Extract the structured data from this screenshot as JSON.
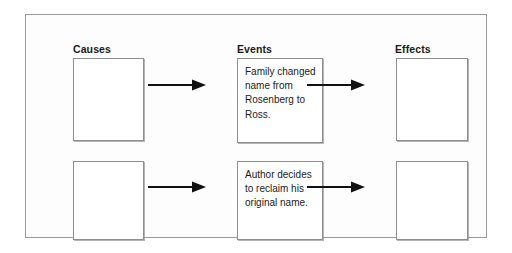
{
  "diagram": {
    "type": "cause-event-effect-organizer",
    "columns": [
      {
        "id": "causes",
        "label": "Causes"
      },
      {
        "id": "events",
        "label": "Events"
      },
      {
        "id": "effects",
        "label": "Effects"
      }
    ],
    "rows": [
      {
        "causes_text": "",
        "events_text": "Family changed name from Rosenberg to Ross.",
        "effects_text": ""
      },
      {
        "causes_text": "",
        "events_text": "Author decides to reclaim his original name.",
        "effects_text": ""
      }
    ],
    "arrows": [
      {
        "id": "causes-to-events-row1",
        "direction": "right"
      },
      {
        "id": "events-to-effects-row1",
        "direction": "right"
      },
      {
        "id": "causes-to-events-row2",
        "direction": "right"
      },
      {
        "id": "events-to-effects-row2",
        "direction": "right"
      }
    ],
    "colors": {
      "page_background": "#ffffff",
      "frame_background": "#fdfdfd",
      "frame_border": "#9a9a9a",
      "box_border": "#8e8e8e",
      "box_background": "#ffffff",
      "text": "#1a1a1a",
      "arrow": "#111111"
    }
  }
}
